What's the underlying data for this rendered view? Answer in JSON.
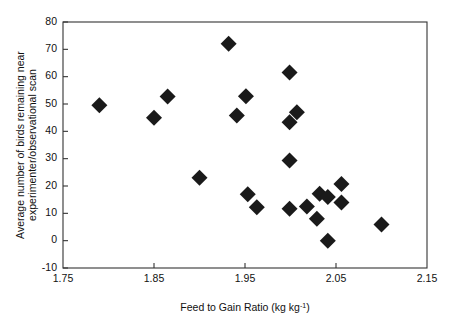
{
  "chart_data": {
    "type": "scatter",
    "title": "",
    "xlabel": "Feed to Gain Ratio (kg kg⁻¹)",
    "xlabel_main": "Feed to Gain Ratio (kg kg",
    "xlabel_sup": "-1",
    "xlabel_tail": ")",
    "ylabel": "Average number of birds remaining near experimenter/observational scan",
    "ylabel_line1": "Average number of birds remaining near",
    "ylabel_line2": "experimenter/observational scan",
    "xlim": [
      1.75,
      2.15
    ],
    "ylim": [
      -10,
      80
    ],
    "xticks": [
      1.75,
      1.85,
      1.95,
      2.05,
      2.15
    ],
    "xticklabels": [
      "1.75",
      "1.85",
      "1.95",
      "2.05",
      "2.15"
    ],
    "yticks": [
      -10,
      0,
      10,
      20,
      30,
      40,
      50,
      60,
      70,
      80
    ],
    "yticklabels": [
      "-10",
      "0",
      "10",
      "20",
      "30",
      "40",
      "50",
      "60",
      "70",
      "80"
    ],
    "grid": false,
    "legend": null,
    "marker": "diamond",
    "marker_color": "#1a1a1a",
    "marker_size": 8,
    "points": [
      {
        "x": 1.79,
        "y": 49.5
      },
      {
        "x": 1.85,
        "y": 45.0
      },
      {
        "x": 1.865,
        "y": 52.7
      },
      {
        "x": 1.932,
        "y": 72.0
      },
      {
        "x": 1.941,
        "y": 45.8
      },
      {
        "x": 1.9,
        "y": 23.0
      },
      {
        "x": 1.951,
        "y": 52.8
      },
      {
        "x": 1.953,
        "y": 17.0
      },
      {
        "x": 1.963,
        "y": 12.2
      },
      {
        "x": 1.999,
        "y": 61.5
      },
      {
        "x": 2.007,
        "y": 47.0
      },
      {
        "x": 1.999,
        "y": 43.3
      },
      {
        "x": 1.999,
        "y": 29.3
      },
      {
        "x": 1.999,
        "y": 11.7
      },
      {
        "x": 2.018,
        "y": 12.5
      },
      {
        "x": 2.032,
        "y": 17.2
      },
      {
        "x": 2.041,
        "y": 16.0
      },
      {
        "x": 2.056,
        "y": 20.7
      },
      {
        "x": 2.056,
        "y": 14.0
      },
      {
        "x": 2.029,
        "y": 8.0
      },
      {
        "x": 2.041,
        "y": 0.0
      },
      {
        "x": 2.1,
        "y": 5.9
      }
    ]
  },
  "figure": {
    "background": "#ffffff",
    "axis_color": "#333333",
    "text_color": "#111111"
  }
}
